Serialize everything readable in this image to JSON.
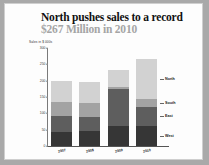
{
  "title": {
    "dark": "North pushes sales to a record",
    "gray": " $267 Million in 2010"
  },
  "colors": {
    "title_dark": "#111111",
    "title_gray": "#a5a5a5",
    "north": "#d2d2d2",
    "south": "#a3a3a3",
    "east": "#5e5e5e",
    "west": "#363636",
    "background": "#fdfdfd",
    "page": "#a9a9a9"
  },
  "chart_data": {
    "type": "bar",
    "title": "North pushes sales to a record $267 Million in 2010",
    "subtitle": "",
    "xlabel": "",
    "ylabel": "Sales in $ 000s",
    "categories": [
      "2007",
      "2008",
      "2009",
      "2010"
    ],
    "ylim": [
      0,
      300
    ],
    "yticks": [
      0,
      50,
      100,
      150,
      200,
      250,
      300
    ],
    "ytick_labels": [
      "0",
      "50",
      "100",
      "150",
      "200",
      "250",
      "300"
    ],
    "grid": false,
    "stacked": true,
    "legend_position": "right",
    "series": [
      {
        "name": "West",
        "color": "#363636",
        "values": [
          42,
          45,
          60,
          62
        ]
      },
      {
        "name": "East",
        "color": "#5e5e5e",
        "values": [
          50,
          45,
          115,
          57
        ]
      },
      {
        "name": "South",
        "color": "#a3a3a3",
        "values": [
          42,
          42,
          5,
          25
        ]
      },
      {
        "name": "North",
        "color": "#d2d2d2",
        "values": [
          66,
          63,
          52,
          123
        ]
      }
    ],
    "totals": [
      200,
      195,
      232,
      267
    ]
  },
  "legend": {
    "entries": [
      {
        "label": "North"
      },
      {
        "label": "South"
      },
      {
        "label": "East"
      },
      {
        "label": "West"
      }
    ]
  }
}
